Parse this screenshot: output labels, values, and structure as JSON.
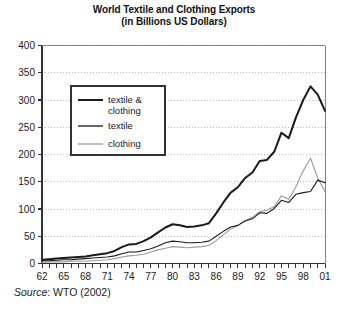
{
  "chart_data": {
    "type": "line",
    "title": "World Textile and Clothing Exports",
    "subtitle": "(in Billions US Dollars)",
    "xlabel": "",
    "ylabel": "",
    "ylim": [
      0,
      400
    ],
    "ytick_step": 50,
    "yticks": [
      "0",
      "50",
      "100",
      "150",
      "200",
      "250",
      "300",
      "350",
      "400"
    ],
    "xlim": [
      1962,
      2001
    ],
    "xtick_step": 3,
    "xticks": [
      "62",
      "65",
      "68",
      "71",
      "74",
      "77",
      "80",
      "83",
      "86",
      "89",
      "92",
      "95",
      "98",
      "01"
    ],
    "x_minor_ticks_every_year": true,
    "grid": "horizontal-dotted",
    "legend_position": "upper-left-inside",
    "x": [
      1962,
      1963,
      1964,
      1965,
      1966,
      1967,
      1968,
      1969,
      1970,
      1971,
      1972,
      1973,
      1974,
      1975,
      1976,
      1977,
      1978,
      1979,
      1980,
      1981,
      1982,
      1983,
      1984,
      1985,
      1986,
      1987,
      1988,
      1989,
      1990,
      1991,
      1992,
      1993,
      1994,
      1995,
      1996,
      1997,
      1998,
      1999,
      2000,
      2001
    ],
    "series": [
      {
        "name": "textile & clothing",
        "style": "thick-solid-black",
        "color": "#1a1a1a",
        "values": [
          7,
          8,
          9,
          10,
          11,
          12,
          13,
          15,
          17,
          19,
          23,
          30,
          35,
          36,
          41,
          48,
          57,
          66,
          72,
          70,
          67,
          68,
          70,
          74,
          92,
          112,
          130,
          140,
          157,
          167,
          188,
          190,
          205,
          240,
          230,
          268,
          300,
          325,
          310,
          280
        ],
        "values_note": "combined textile and clothing exports"
      },
      {
        "name": "textile",
        "style": "thin-solid-black",
        "color": "#1a1a1a",
        "values": [
          5,
          5,
          6,
          7,
          7,
          8,
          9,
          10,
          11,
          12,
          14,
          18,
          21,
          21,
          24,
          27,
          32,
          38,
          41,
          40,
          38,
          38,
          39,
          41,
          50,
          59,
          67,
          70,
          78,
          82,
          93,
          92,
          101,
          116,
          112,
          127,
          130,
          132,
          153,
          148
        ],
        "values_note": "textile only"
      },
      {
        "name": "clothing",
        "style": "thin-solid-gray",
        "color": "#9a9a9a",
        "values": [
          2,
          3,
          3,
          3,
          4,
          4,
          4,
          5,
          6,
          7,
          9,
          12,
          14,
          15,
          17,
          21,
          25,
          28,
          31,
          30,
          29,
          30,
          31,
          33,
          42,
          53,
          63,
          70,
          79,
          85,
          95,
          98,
          104,
          124,
          118,
          141,
          170,
          193,
          157,
          132
        ],
        "values_note": "clothing only"
      }
    ],
    "legend": [
      {
        "label_line1": "textile &",
        "label_line2": "clothing",
        "swatch": "thick-black-line"
      },
      {
        "label_line1": "textile",
        "label_line2": "",
        "swatch": "thin-black-line"
      },
      {
        "label_line1": "clothing",
        "label_line2": "",
        "swatch": "thin-gray-line"
      }
    ],
    "source_prefix": "Source",
    "source_rest": ": WTO (2002)"
  }
}
